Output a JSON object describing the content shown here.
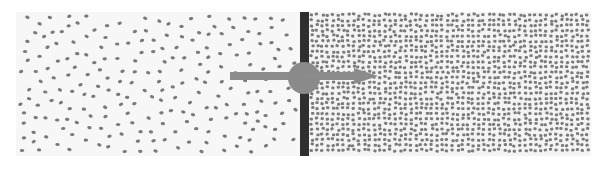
{
  "diagram": {
    "colors": {
      "background": "#ffffff",
      "left_chamber_fill": "#f7f7f7",
      "right_chamber_fill": "#f4f4f4",
      "particle": "#7a7a7a",
      "wall": "#2f2f2f",
      "opening": "#8a8a8a",
      "arrow": "#8c8c8c"
    },
    "left_chamber": {
      "label": "low-density-region",
      "x": 16,
      "y": 12,
      "width": 284,
      "height": 144,
      "particle_count": 230,
      "seed": 7,
      "particle_rx": 2.2,
      "particle_ry": 1.6
    },
    "right_chamber": {
      "label": "high-density-region",
      "x": 309,
      "y": 12,
      "width": 282,
      "height": 144,
      "particle_spacing": 5.2,
      "seed": 13,
      "particle_w": 3.2,
      "particle_h": 2.8
    },
    "wall": {
      "x": 300,
      "y": 12,
      "width": 9,
      "height": 144
    },
    "opening": {
      "cx": 304,
      "cy": 78,
      "r": 16
    },
    "arrow": {
      "x1": 230,
      "x2": 378,
      "y": 76,
      "thickness": 8,
      "head_length": 24,
      "head_width": 16
    }
  }
}
